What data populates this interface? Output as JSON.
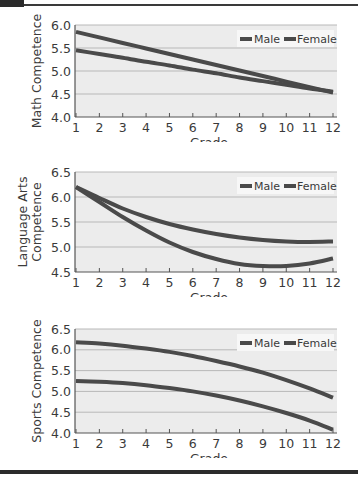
{
  "chart_data": [
    {
      "type": "line",
      "title": "",
      "xlabel": "Grade",
      "ylabel": "Math Competence",
      "ylim": [
        4.0,
        6.0
      ],
      "yticks": [
        "4.0",
        "4.5",
        "5.0",
        "5.5",
        "6.0"
      ],
      "x": [
        1,
        2,
        3,
        4,
        5,
        6,
        7,
        8,
        9,
        10,
        11,
        12
      ],
      "grid": true,
      "legend": {
        "position": "upper right",
        "entries": [
          "Male",
          "Female"
        ]
      },
      "series": [
        {
          "name": "Male",
          "values": [
            5.85,
            5.73,
            5.61,
            5.49,
            5.37,
            5.25,
            5.13,
            5.01,
            4.89,
            4.77,
            4.65,
            4.53
          ]
        },
        {
          "name": "Female",
          "values": [
            5.45,
            5.37,
            5.29,
            5.2,
            5.12,
            5.03,
            4.95,
            4.86,
            4.78,
            4.7,
            4.62,
            4.55
          ]
        }
      ]
    },
    {
      "type": "line",
      "title": "",
      "xlabel": "Grade",
      "ylabel": "Language Arts Competence",
      "ylim": [
        4.5,
        6.5
      ],
      "yticks": [
        "4.5",
        "5.0",
        "5.5",
        "6.0",
        "6.5"
      ],
      "x": [
        1,
        2,
        3,
        4,
        5,
        6,
        7,
        8,
        9,
        10,
        11,
        12
      ],
      "grid": true,
      "legend": {
        "position": "upper right",
        "entries": [
          "Male",
          "Female"
        ]
      },
      "series": [
        {
          "name": "Male",
          "values": [
            6.2,
            5.98,
            5.77,
            5.6,
            5.46,
            5.35,
            5.26,
            5.19,
            5.14,
            5.11,
            5.1,
            5.11
          ]
        },
        {
          "name": "Female",
          "values": [
            6.2,
            5.9,
            5.6,
            5.33,
            5.09,
            4.9,
            4.76,
            4.66,
            4.62,
            4.62,
            4.67,
            4.77
          ]
        }
      ]
    },
    {
      "type": "line",
      "title": "",
      "xlabel": "Grade",
      "ylabel": "Sports Competence",
      "ylim": [
        4.0,
        6.5
      ],
      "yticks": [
        "4.0",
        "4.5",
        "5.0",
        "5.5",
        "6.0",
        "6.5"
      ],
      "x": [
        1,
        2,
        3,
        4,
        5,
        6,
        7,
        8,
        9,
        10,
        11,
        12
      ],
      "grid": true,
      "legend": {
        "position": "upper right",
        "entries": [
          "Male",
          "Female"
        ]
      },
      "series": [
        {
          "name": "Male",
          "values": [
            6.18,
            6.15,
            6.1,
            6.03,
            5.95,
            5.85,
            5.73,
            5.6,
            5.45,
            5.27,
            5.07,
            4.85
          ]
        },
        {
          "name": "Female",
          "values": [
            5.25,
            5.23,
            5.2,
            5.15,
            5.08,
            5.0,
            4.9,
            4.78,
            4.64,
            4.48,
            4.3,
            4.08
          ]
        }
      ]
    }
  ],
  "colors": {
    "line": "#4a4a4a",
    "plot_bg": "#ececec",
    "grid": "#b8b8b8",
    "axis": "#555555"
  }
}
